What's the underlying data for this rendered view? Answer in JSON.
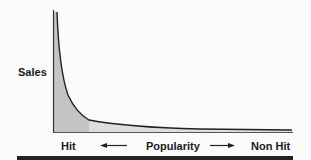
{
  "diagram": {
    "type": "long-tail-curve",
    "y_axis_label": "Sales",
    "x_axis": {
      "left_label": "Hit",
      "center_label": "Popularity",
      "right_label": "Non Hit",
      "left_arrow": "arrow-left-icon",
      "right_arrow": "arrow-right-icon"
    },
    "regions": [
      {
        "name": "head",
        "description": "Hit region (darker shading)",
        "color": "#c4c4c4"
      },
      {
        "name": "tail",
        "description": "Long tail region (lighter shading)",
        "color": "#dedede"
      }
    ],
    "colors": {
      "curve": "#222222",
      "axis": "#333333",
      "head_fill": "#c4c4c4",
      "tail_fill": "#dedede",
      "rule": "#222222"
    }
  }
}
